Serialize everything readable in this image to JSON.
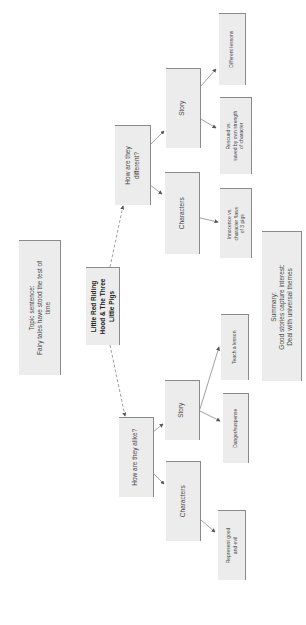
{
  "diagram": {
    "orientation": "rotated-90-clockwise",
    "central": {
      "lines": [
        "Little Red Riding",
        "Hood & The Three",
        "Little Pigs"
      ]
    },
    "topic": {
      "lines": [
        "Topic sentence:",
        "Fairy tales have stood the test of",
        "time"
      ]
    },
    "summary": {
      "lines": [
        "Summary:",
        "Good stories capture interest:",
        "Deal with universal themes"
      ]
    },
    "branches": {
      "different": {
        "label_lines": [
          "How are they",
          "different?"
        ],
        "story": {
          "label": "Story",
          "children": [
            {
              "lines": [
                "Different lessons"
              ]
            },
            {
              "lines": [
                "Rescued vs.",
                "saved by own strength",
                "of character"
              ]
            }
          ]
        },
        "characters": {
          "label": "Characters",
          "children": [
            {
              "lines": [
                "Innocence vs.",
                "character flaws",
                "of 3 pigs"
              ]
            }
          ]
        }
      },
      "alike": {
        "label_lines": [
          "How are they alike?"
        ],
        "story": {
          "label": "Story",
          "children": [
            {
              "lines": [
                "Teach a lesson"
              ]
            },
            {
              "lines": [
                "Danger/suspense"
              ]
            }
          ]
        },
        "characters": {
          "label": "Characters",
          "children": [
            {
              "lines": [
                "Represent good",
                "and evil"
              ]
            }
          ]
        }
      }
    }
  }
}
